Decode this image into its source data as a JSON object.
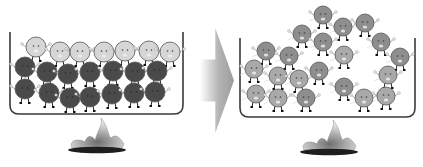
{
  "diagram": {
    "colors": {
      "background": "#ffffff",
      "container_stroke": "#3a3a3a",
      "dark_particle": "#4a4a4a",
      "light_particle": "#d6d6d6",
      "mid_particle": "#8e8e8e",
      "particle_outline": "#555555",
      "arrow": "#a8a8a8",
      "burner_base": "#1e1e1e",
      "flame": "#9a9a9a"
    },
    "left_panel": {
      "label": "before-heating",
      "container": {
        "x": 10,
        "y": 32,
        "w": 173,
        "h": 82
      },
      "particles": [
        {
          "x": 36,
          "y": 47,
          "r": 10,
          "tone": "light"
        },
        {
          "x": 60,
          "y": 52,
          "r": 10,
          "tone": "light"
        },
        {
          "x": 80,
          "y": 52,
          "r": 10,
          "tone": "light"
        },
        {
          "x": 104,
          "y": 52,
          "r": 10,
          "tone": "light"
        },
        {
          "x": 125,
          "y": 51,
          "r": 10,
          "tone": "light"
        },
        {
          "x": 149,
          "y": 51,
          "r": 10,
          "tone": "light"
        },
        {
          "x": 170,
          "y": 52,
          "r": 10,
          "tone": "light"
        },
        {
          "x": 25,
          "y": 67,
          "r": 10,
          "tone": "dark"
        },
        {
          "x": 47,
          "y": 72,
          "r": 10,
          "tone": "dark"
        },
        {
          "x": 68,
          "y": 74,
          "r": 10,
          "tone": "dark"
        },
        {
          "x": 90,
          "y": 72,
          "r": 10,
          "tone": "dark"
        },
        {
          "x": 113,
          "y": 71,
          "r": 10,
          "tone": "dark"
        },
        {
          "x": 135,
          "y": 72,
          "r": 10,
          "tone": "dark"
        },
        {
          "x": 157,
          "y": 71,
          "r": 10,
          "tone": "dark"
        },
        {
          "x": 25,
          "y": 89,
          "r": 10,
          "tone": "dark"
        },
        {
          "x": 49,
          "y": 93,
          "r": 10,
          "tone": "dark"
        },
        {
          "x": 70,
          "y": 98,
          "r": 10,
          "tone": "dark"
        },
        {
          "x": 90,
          "y": 97,
          "r": 10,
          "tone": "dark"
        },
        {
          "x": 112,
          "y": 94,
          "r": 10,
          "tone": "dark"
        },
        {
          "x": 134,
          "y": 93,
          "r": 10,
          "tone": "dark"
        },
        {
          "x": 155,
          "y": 92,
          "r": 10,
          "tone": "dark"
        }
      ],
      "burner": {
        "cx": 97,
        "cy": 148,
        "w": 58
      }
    },
    "arrow": {
      "x": 200,
      "y": 28,
      "w": 34,
      "h": 105
    },
    "right_panel": {
      "label": "after-heating",
      "container": {
        "x": 240,
        "y": 38,
        "w": 175,
        "h": 79
      },
      "particles": [
        {
          "x": 323,
          "y": 15,
          "r": 9,
          "tone": "mid"
        },
        {
          "x": 343,
          "y": 27,
          "r": 9,
          "tone": "mid"
        },
        {
          "x": 365,
          "y": 23,
          "r": 9,
          "tone": "mid"
        },
        {
          "x": 302,
          "y": 34,
          "r": 9,
          "tone": "mid"
        },
        {
          "x": 323,
          "y": 42,
          "r": 9,
          "tone": "mid"
        },
        {
          "x": 381,
          "y": 42,
          "r": 9,
          "tone": "mid"
        },
        {
          "x": 266,
          "y": 51,
          "r": 9,
          "tone": "mid"
        },
        {
          "x": 289,
          "y": 56,
          "r": 9,
          "tone": "mid"
        },
        {
          "x": 344,
          "y": 55,
          "r": 9,
          "tone": "midlight"
        },
        {
          "x": 400,
          "y": 57,
          "r": 9,
          "tone": "mid"
        },
        {
          "x": 254,
          "y": 69,
          "r": 9,
          "tone": "midlight"
        },
        {
          "x": 278,
          "y": 76,
          "r": 9,
          "tone": "midlight"
        },
        {
          "x": 299,
          "y": 79,
          "r": 9,
          "tone": "midlight"
        },
        {
          "x": 319,
          "y": 71,
          "r": 9,
          "tone": "mid"
        },
        {
          "x": 388,
          "y": 75,
          "r": 9,
          "tone": "midlight"
        },
        {
          "x": 256,
          "y": 94,
          "r": 9,
          "tone": "midlight"
        },
        {
          "x": 278,
          "y": 98,
          "r": 9,
          "tone": "midlight"
        },
        {
          "x": 306,
          "y": 98,
          "r": 9,
          "tone": "mid"
        },
        {
          "x": 344,
          "y": 87,
          "r": 9,
          "tone": "mid"
        },
        {
          "x": 364,
          "y": 98,
          "r": 9,
          "tone": "midlight"
        },
        {
          "x": 386,
          "y": 96,
          "r": 9,
          "tone": "midlight"
        }
      ],
      "burner": {
        "cx": 329,
        "cy": 150,
        "w": 58
      }
    }
  }
}
